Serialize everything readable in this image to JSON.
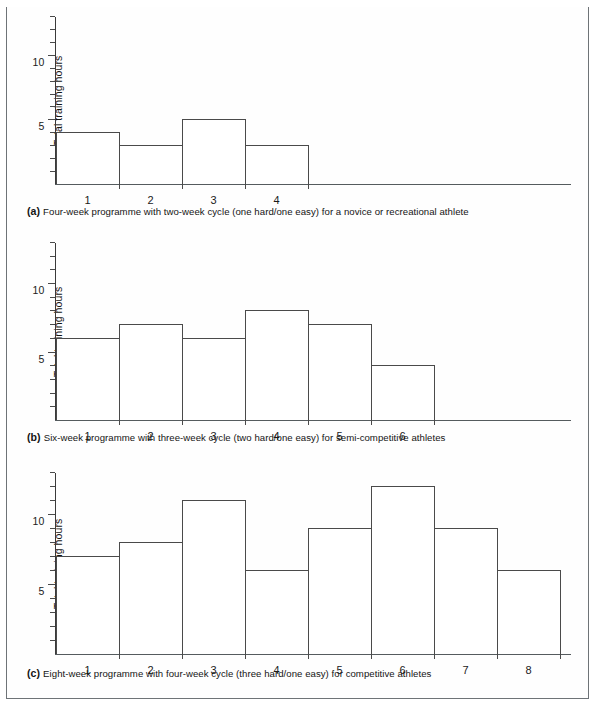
{
  "figure": {
    "y_axis_label": "Total training hours",
    "y_ticks_labeled": [
      "5",
      "10"
    ]
  },
  "chart_data": [
    {
      "id": "a",
      "type": "bar",
      "title": "",
      "panel_letter": "(a)",
      "caption": "Four-week programme with two-week cycle (one hard/one easy) for a novice or recreational athlete",
      "categories": [
        "1",
        "2",
        "3",
        "4"
      ],
      "values": [
        4,
        3,
        5,
        3
      ],
      "xlabel": "",
      "ylabel": "Total training hours",
      "ylim": [
        0,
        13
      ],
      "ytick_labels": [
        "5",
        "10"
      ],
      "ytick_values": [
        5,
        10
      ],
      "minor_tick_step": 1,
      "grid": false,
      "legend": false
    },
    {
      "id": "b",
      "type": "bar",
      "title": "",
      "panel_letter": "(b)",
      "caption": "Six-week programme with three-week cycle (two hard/one easy) for semi-competitive athletes",
      "categories": [
        "1",
        "2",
        "3",
        "4",
        "5",
        "6"
      ],
      "values": [
        6,
        7,
        6,
        8,
        7,
        4
      ],
      "xlabel": "",
      "ylabel": "Total training hours",
      "ylim": [
        0,
        13
      ],
      "ytick_labels": [
        "5",
        "10"
      ],
      "ytick_values": [
        5,
        10
      ],
      "minor_tick_step": 1,
      "grid": false,
      "legend": false
    },
    {
      "id": "c",
      "type": "bar",
      "title": "",
      "panel_letter": "(c)",
      "caption": "Eight-week programme with four-week cycle (three hard/one easy) for competitive athletes",
      "categories": [
        "1",
        "2",
        "3",
        "4",
        "5",
        "6",
        "7",
        "8"
      ],
      "values": [
        7,
        8,
        11,
        6,
        9,
        12,
        9,
        6
      ],
      "xlabel": "",
      "ylabel": "Total training hours",
      "ylim": [
        0,
        13
      ],
      "ytick_labels": [
        "5",
        "10"
      ],
      "ytick_values": [
        5,
        10
      ],
      "minor_tick_step": 1,
      "grid": false,
      "legend": false
    }
  ]
}
